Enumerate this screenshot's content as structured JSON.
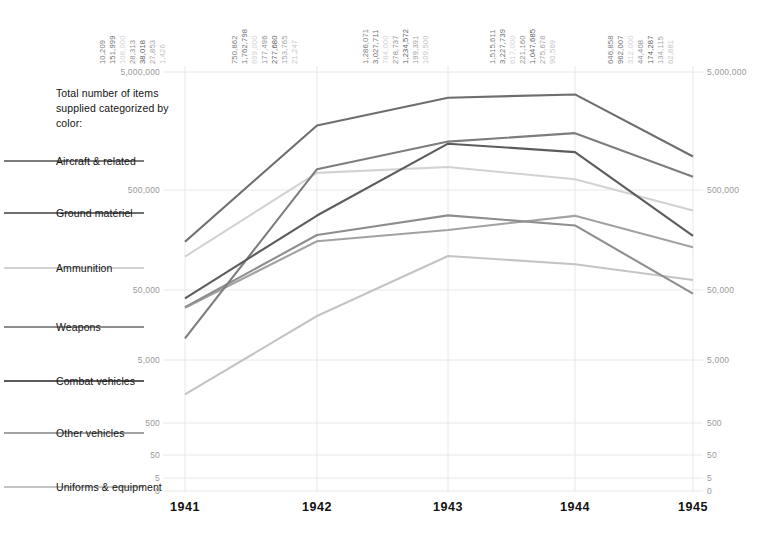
{
  "legend": {
    "title": "Total number of items supplied categorized by color:",
    "items": [
      {
        "label": "Aircraft & related",
        "color": "#7d7d7d"
      },
      {
        "label": "Ground matériel",
        "color": "#6e6e6e"
      },
      {
        "label": "Ammunition",
        "color": "#d2d2d2"
      },
      {
        "label": "Weapons",
        "color": "#8e8e8e"
      },
      {
        "label": "Combat vehicles",
        "color": "#5c5c5c"
      },
      {
        "label": "Other vehicles",
        "color": "#a2a2a2"
      },
      {
        "label": "Uniforms & equipment",
        "color": "#c4c4c4"
      }
    ]
  },
  "axis": {
    "ticks": [
      "5,000,000",
      "500,000",
      "50,000",
      "5,000",
      "500",
      "50",
      "5",
      "0"
    ],
    "tick_color": "#9a9a9a",
    "grid_color": "#e8e8e8"
  },
  "chart_data": {
    "type": "line",
    "title": "Total number of items supplied categorized by color:",
    "xlabel": "",
    "ylabel": "",
    "scale": "log",
    "grid": true,
    "legend_position": "left",
    "categories": [
      "1941",
      "1942",
      "1943",
      "1944",
      "1945"
    ],
    "yticks": [
      5000000,
      500000,
      50000,
      5000,
      500,
      50,
      5,
      0
    ],
    "ylim": [
      0,
      5000000
    ],
    "series": [
      {
        "name": "Aircraft & related",
        "color": "#7d7d7d",
        "values": [
          10209,
          750862,
          1286071,
          1515611,
          646858
        ],
        "labels": [
          "10,209",
          "750,862",
          "1,286,071",
          "1,515,611",
          "646,858"
        ]
      },
      {
        "name": "Ground matériel",
        "color": "#6e6e6e",
        "values": [
          151999,
          1762798,
          3027711,
          3227739,
          962007
        ],
        "labels": [
          "151,999",
          "1,762,798",
          "3,027,711",
          "3,227,739",
          "962,007"
        ]
      },
      {
        "name": "Ammunition",
        "color": "#d2d2d2",
        "values": [
          108000,
          699000,
          784000,
          617000,
          312000
        ],
        "labels": [
          "108,000",
          "699,000",
          "784,000",
          "617,000",
          "312,000"
        ]
      },
      {
        "name": "Weapons",
        "color": "#8e8e8e",
        "values": [
          28313,
          177496,
          278737,
          221160,
          44408
        ],
        "labels": [
          "28,313",
          "177,496",
          "278,737",
          "221,160",
          "44,408"
        ]
      },
      {
        "name": "Combat vehicles",
        "color": "#5c5c5c",
        "values": [
          38018,
          277680,
          1234572,
          1047685,
          174287
        ],
        "labels": [
          "38,018",
          "277,680",
          "1,234,572",
          "1,047,685",
          "174,287"
        ]
      },
      {
        "name": "Other vehicles",
        "color": "#a2a2a2",
        "values": [
          27853,
          153765,
          199391,
          275678,
          134115
        ],
        "labels": [
          "27,853",
          "153,765",
          "199,391",
          "275,678",
          "134,115"
        ]
      },
      {
        "name": "Uniforms & equipment",
        "color": "#c4c4c4",
        "values": [
          1426,
          21247,
          109500,
          90569,
          62881
        ],
        "labels": [
          "1,426",
          "21,247",
          "109,500",
          "90,569",
          "62,881"
        ]
      }
    ]
  }
}
